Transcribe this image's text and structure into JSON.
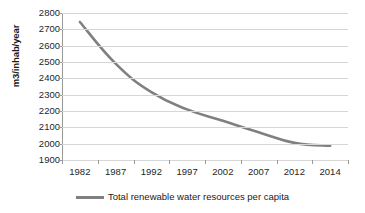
{
  "chart_data": {
    "type": "line",
    "title": "",
    "xlabel": "",
    "ylabel": "m3/inhab/year",
    "categories": [
      "1982",
      "1987",
      "1992",
      "1997",
      "2002",
      "2007",
      "2012",
      "2014"
    ],
    "series": [
      {
        "name": "Total renewable water resources per capita",
        "color": "#808080",
        "values": [
          2745,
          2490,
          2315,
          2210,
          2140,
          2070,
          2005,
          1988
        ]
      }
    ],
    "ylim": [
      1900,
      2800
    ],
    "ytick_step": 100,
    "yticks": [
      "2800",
      "2700",
      "2600",
      "2500",
      "2400",
      "2300",
      "2200",
      "2100",
      "2000",
      "1900"
    ],
    "grid": true,
    "legend_position": "bottom",
    "annotations": []
  },
  "legend": {
    "entries": [
      {
        "label": "Total renewable water resources per capita",
        "color": "#808080"
      }
    ]
  },
  "colors": {
    "series_line": "#808080",
    "gridline": "#d6d6d6",
    "axis": "#9a9a9a",
    "text": "#262626",
    "background": "#ffffff"
  }
}
